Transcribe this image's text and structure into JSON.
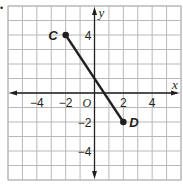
{
  "problem_marker": "•",
  "chart_data": {
    "type": "line",
    "title": "",
    "xlabel": "x",
    "ylabel": "y",
    "xlim": [
      -6,
      6
    ],
    "ylim": [
      -6,
      6
    ],
    "grid": true,
    "grid_step": 1,
    "x_ticks": [
      {
        "value": -4,
        "label": "−4"
      },
      {
        "value": -2,
        "label": "−2"
      },
      {
        "value": 2,
        "label": "2"
      },
      {
        "value": 4,
        "label": "4"
      }
    ],
    "y_ticks": [
      {
        "value": 4,
        "label": "4"
      },
      {
        "value": -2,
        "label": "−2"
      },
      {
        "value": -4,
        "label": "−4"
      }
    ],
    "origin_label": "O",
    "series": [
      {
        "name": "segment CD",
        "points": [
          {
            "label": "C",
            "x": -2,
            "y": 4
          },
          {
            "label": "D",
            "x": 2,
            "y": -2
          }
        ]
      }
    ],
    "colors": {
      "grid": "#b8b8b8",
      "axis": "#231f20",
      "segment": "#231f20",
      "text": "#231f20"
    }
  }
}
